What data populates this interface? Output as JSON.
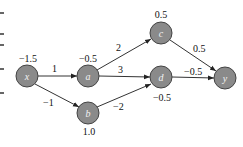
{
  "diagram": {
    "type": "computational-graph",
    "nodes": [
      {
        "id": "x",
        "label": "x",
        "value": "−1.5",
        "cx": 27,
        "cy": 76,
        "value_pos": "top"
      },
      {
        "id": "a",
        "label": "a",
        "value": "−0.5",
        "cx": 88,
        "cy": 76,
        "value_pos": "top"
      },
      {
        "id": "b",
        "label": "b",
        "value": "1.0",
        "cx": 88,
        "cy": 113,
        "value_pos": "bottom"
      },
      {
        "id": "c",
        "label": "c",
        "value": "0.5",
        "cx": 161,
        "cy": 33,
        "value_pos": "top"
      },
      {
        "id": "d",
        "label": "d",
        "value": "−0.5",
        "cx": 161,
        "cy": 77,
        "value_pos": "bottom"
      },
      {
        "id": "y",
        "label": "y",
        "value": "",
        "cx": 225,
        "cy": 78,
        "value_pos": "none"
      }
    ],
    "edges": [
      {
        "from": "x",
        "to": "a",
        "weight": "1"
      },
      {
        "from": "x",
        "to": "b",
        "weight": "−1"
      },
      {
        "from": "a",
        "to": "c",
        "weight": "2"
      },
      {
        "from": "a",
        "to": "d",
        "weight": "3"
      },
      {
        "from": "b",
        "to": "d",
        "weight": "−2"
      },
      {
        "from": "c",
        "to": "y",
        "weight": "0.5"
      },
      {
        "from": "d",
        "to": "y",
        "weight": "−0.5"
      }
    ]
  },
  "labels": {
    "x_node": "x",
    "a_node": "a",
    "b_node": "b",
    "c_node": "c",
    "d_node": "d",
    "y_node": "y",
    "x_value": "−1.5",
    "a_value": "−0.5",
    "b_value": "1.0",
    "c_value": "0.5",
    "d_value": "−0.5",
    "w_xa": "1",
    "w_xb": "−1",
    "w_ac": "2",
    "w_ad": "3",
    "w_bd": "−2",
    "w_cy": "0.5",
    "w_dy": "−0.5"
  }
}
